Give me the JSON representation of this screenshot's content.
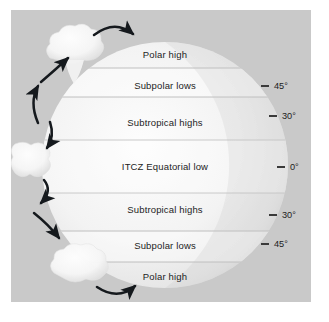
{
  "figure": {
    "type": "globe-pressure-belt-diagram",
    "background_color": "#c9c9c9",
    "globe_color": "#f2f2f2"
  },
  "globe": {
    "center_x": 154,
    "center_y": 155,
    "radius": 123
  },
  "bands": [
    {
      "id": "polar-high-north",
      "label": "Polar high",
      "y": 45,
      "hemisphere": "north"
    },
    {
      "id": "subpolar-lows-north",
      "label": "Subpolar lows",
      "y": 76,
      "hemisphere": "north"
    },
    {
      "id": "subtropical-highs-north",
      "label": "Subtropical highs",
      "y": 113,
      "hemisphere": "north"
    },
    {
      "id": "itcz-equatorial-low",
      "label": "ITCZ Equatorial low",
      "y": 157,
      "hemisphere": "equator"
    },
    {
      "id": "subtropical-highs-south",
      "label": "Subtropical highs",
      "y": 200,
      "hemisphere": "south"
    },
    {
      "id": "subpolar-lows-south",
      "label": "Subpolar lows",
      "y": 236,
      "hemisphere": "south"
    },
    {
      "id": "polar-high-south",
      "label": "Polar high",
      "y": 267,
      "hemisphere": "south"
    }
  ],
  "band_dividers_y": [
    58,
    87,
    130,
    183,
    221,
    252
  ],
  "latitudes": [
    {
      "id": "lat-45-north",
      "label": "45°",
      "y": 76,
      "dash_x": 250,
      "text_x": 266
    },
    {
      "id": "lat-30-north",
      "label": "30°",
      "y": 106,
      "dash_x": 258,
      "text_x": 274
    },
    {
      "id": "lat-0",
      "label": "0°",
      "y": 157,
      "dash_x": 266,
      "text_x": 282
    },
    {
      "id": "lat-30-south",
      "label": "30°",
      "y": 205,
      "dash_x": 258,
      "text_x": 274
    },
    {
      "id": "lat-45-south",
      "label": "45°",
      "y": 234,
      "dash_x": 250,
      "text_x": 266
    }
  ],
  "clouds": [
    {
      "id": "cloud-polar-north",
      "cx": 63,
      "cy": 38,
      "scale": 1.0
    },
    {
      "id": "cloud-equatorial",
      "cx": 20,
      "cy": 150,
      "scale": 0.8
    },
    {
      "id": "cloud-polar-south",
      "cx": 69,
      "cy": 257,
      "scale": 0.95
    }
  ],
  "arrows": [
    {
      "id": "arrow-polar-cell-top",
      "description": "curved arrow arcing right over the north polar cloud"
    },
    {
      "id": "arrow-ferrel-cell-ascending",
      "description": "curved arrow rising toward the north polar cloud"
    },
    {
      "id": "arrow-ferrel-cell-north",
      "description": "curved arrow rising from mid-latitudes"
    },
    {
      "id": "arrow-hadley-cell-north",
      "description": "curved arrow descending from equatorial cloud to the north"
    },
    {
      "id": "arrow-hadley-cell-south",
      "description": "curved arrow descending from equatorial cloud to the south"
    },
    {
      "id": "arrow-ferrel-cell-south",
      "description": "curved arrow descending toward the south polar cloud"
    },
    {
      "id": "arrow-polar-cell-bottom",
      "description": "curved arrow arcing right under the south polar cloud"
    }
  ]
}
